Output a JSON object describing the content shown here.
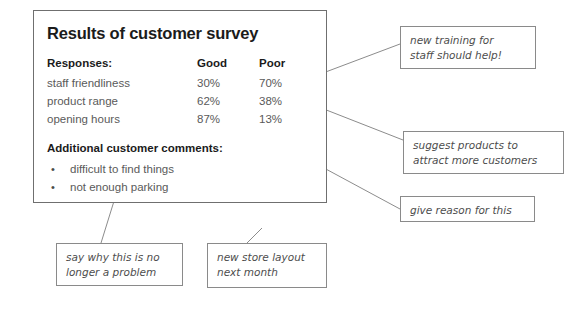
{
  "panel": {
    "title": "Results of customer survey",
    "table": {
      "headers": [
        "Responses:",
        "Good",
        "Poor"
      ],
      "rows": [
        {
          "label": "staff friendliness",
          "good": "30%",
          "poor": "70%"
        },
        {
          "label": "product range",
          "good": "62%",
          "poor": "38%"
        },
        {
          "label": "opening hours",
          "good": "87%",
          "poor": "13%"
        }
      ]
    },
    "comments_heading": "Additional customer comments:",
    "comments": [
      {
        "bullet": "•",
        "text": "difficult to find things"
      },
      {
        "bullet": "•",
        "text": "not enough parking"
      }
    ]
  },
  "annotations": {
    "training": {
      "line1": "new training for",
      "line2": "staff should help!"
    },
    "products": {
      "line1": "suggest products to",
      "line2": "attract more customers"
    },
    "reason": {
      "line1": "give reason for this"
    },
    "problem": {
      "line1": "say why this is no",
      "line2": "longer a problem"
    },
    "layout": {
      "line1": "new store layout",
      "line2": "next month"
    }
  },
  "colors": {
    "panel_border": "#6f6f6f",
    "callout_border": "#8a8a8a",
    "heading_text": "#1b1b1b",
    "body_text": "#5a5a5a",
    "annotation_text": "#4d4d4d",
    "connector_line": "#8c8c8c",
    "background": "#ffffff"
  }
}
